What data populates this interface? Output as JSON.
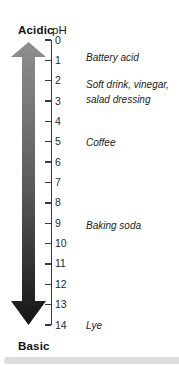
{
  "header": {
    "acidic": "Acidic",
    "ph": "pH"
  },
  "footer": {
    "basic": "Basic"
  },
  "scale": {
    "min": 0,
    "max": 14,
    "step": 1
  },
  "substances": [
    {
      "lines": [
        "Battery acid"
      ],
      "ph": 0.85
    },
    {
      "lines": [
        "Soft drink, vinegar,",
        "salad dressing"
      ],
      "ph": 2.55
    },
    {
      "lines": [
        "Coffee"
      ],
      "ph": 5.05
    },
    {
      "lines": [
        "Baking soda"
      ],
      "ph": 9.1
    },
    {
      "lines": [
        "Lye"
      ],
      "ph": 14
    }
  ],
  "colors": {
    "arrow_top": "#8f8f8f",
    "arrow_mid": "#5c5c5c",
    "arrow_bottom": "#141414",
    "axis": "#3a3a3a",
    "text": "#222222",
    "scrollbar": "#dcdcdc"
  }
}
